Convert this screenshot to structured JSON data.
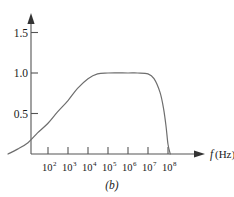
{
  "figure": {
    "caption": "(b)",
    "background_color": "#ffffff",
    "curve_color": "#6e6e6e",
    "axis_color": "#555555",
    "text_color": "#1a1a1a"
  },
  "chart_data": {
    "type": "line",
    "title": "",
    "subtitle": "",
    "xlabel": "f (Hz)",
    "xlabel_parts": {
      "symbol": "f",
      "unit": "(Hz)"
    },
    "ylabel": "",
    "xscale": "log",
    "yscale": "linear",
    "grid": false,
    "legend": null,
    "xlim": [
      1,
      100000000
    ],
    "ylim": [
      0,
      1.7
    ],
    "yticks": [
      0.5,
      1.0,
      1.5
    ],
    "ytick_labels": [
      "0.5",
      "1.0",
      "1.5"
    ],
    "xticks": [
      100,
      1000,
      10000,
      100000,
      1000000,
      10000000,
      100000000
    ],
    "xtick_labels": [
      "10^2",
      "10^3",
      "10^4",
      "10^5",
      "10^6",
      "10^7",
      "10^8"
    ],
    "xtick_bases": [
      "10",
      "10",
      "10",
      "10",
      "10",
      "10",
      "10"
    ],
    "xtick_exponents": [
      "2",
      "3",
      "4",
      "5",
      "6",
      "7",
      "8"
    ],
    "series": [
      {
        "name": "gain",
        "x": [
          1,
          3,
          10,
          30,
          100,
          300,
          1000,
          3000,
          10000,
          30000,
          100000,
          1000000,
          3000000,
          10000000,
          20000000,
          40000000,
          60000000,
          80000000,
          100000000,
          130000000
        ],
        "values": [
          0.0,
          0.06,
          0.14,
          0.26,
          0.38,
          0.52,
          0.66,
          0.81,
          0.93,
          0.99,
          1.0,
          1.0,
          1.0,
          0.99,
          0.93,
          0.76,
          0.56,
          0.34,
          0.12,
          0.0
        ]
      }
    ],
    "annotations": []
  }
}
